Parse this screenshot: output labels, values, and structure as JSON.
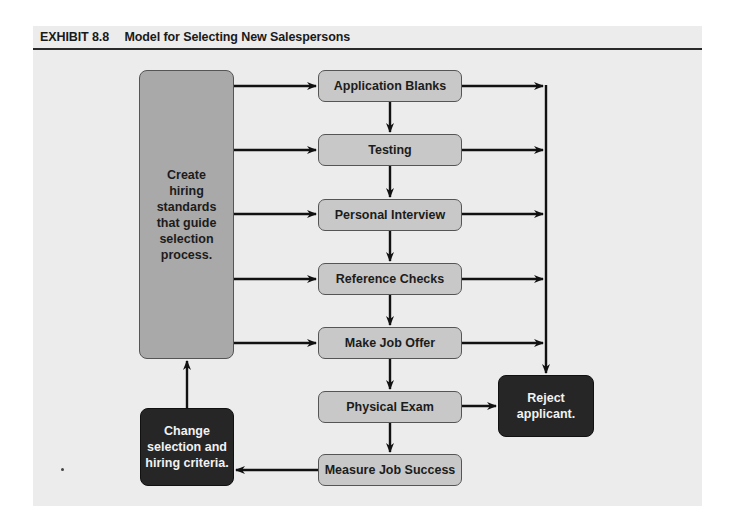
{
  "exhibit": {
    "number": "EXHIBIT 8.8",
    "title": "Model for Selecting New Salespersons"
  },
  "standards_box": {
    "label": "Create hiring standards that guide selection process."
  },
  "steps": [
    {
      "label": "Application Blanks"
    },
    {
      "label": "Testing"
    },
    {
      "label": "Personal Interview"
    },
    {
      "label": "Reference Checks"
    },
    {
      "label": "Make Job Offer"
    },
    {
      "label": "Physical Exam"
    },
    {
      "label": "Measure Job Success"
    }
  ],
  "reject_box": {
    "label": "Reject applicant."
  },
  "feedback_box": {
    "label": "Change selection and hiring criteria."
  },
  "colors": {
    "panel_background": "#ececec",
    "step_fill": "#c8c8c8",
    "standards_fill": "#a9a9a9",
    "terminal_fill": "#262626",
    "line": "#111111"
  }
}
